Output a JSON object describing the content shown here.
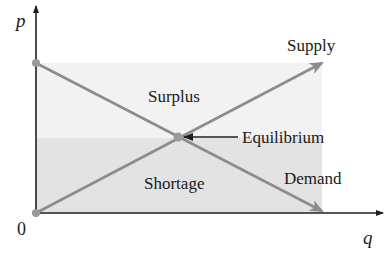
{
  "diagram": {
    "type": "supply-demand",
    "axes": {
      "y_label": "p",
      "x_label": "q",
      "origin_label": "0"
    },
    "curves": {
      "supply_label": "Supply",
      "demand_label": "Demand"
    },
    "regions": {
      "surplus_label": "Surplus",
      "shortage_label": "Shortage"
    },
    "equilibrium_label": "Equilibrium",
    "colors": {
      "axis": "#1f1f1f",
      "curve": "#8c8c8c",
      "surplus_fill": "#f2f2f2",
      "shortage_fill": "#e3e3e3",
      "point": "#9a9a9a"
    }
  }
}
